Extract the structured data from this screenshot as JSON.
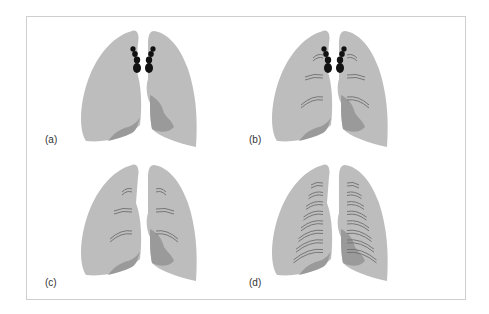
{
  "figure": {
    "panels": [
      {
        "id": "a",
        "label": "(a)",
        "hilar_nodes": true,
        "lines_per_side": 0
      },
      {
        "id": "b",
        "label": "(b)",
        "hilar_nodes": true,
        "lines_per_side": 3
      },
      {
        "id": "c",
        "label": "(c)",
        "hilar_nodes": false,
        "lines_per_side": 3
      },
      {
        "id": "d",
        "label": "(d)",
        "hilar_nodes": false,
        "lines_per_side": 8
      }
    ],
    "colors": {
      "lung": "#bdbdbd",
      "lower_lobe": "#9a9a9a",
      "nodes": "#111111",
      "lines": "#6e6e6e",
      "frame": "#cfcfcf"
    }
  }
}
